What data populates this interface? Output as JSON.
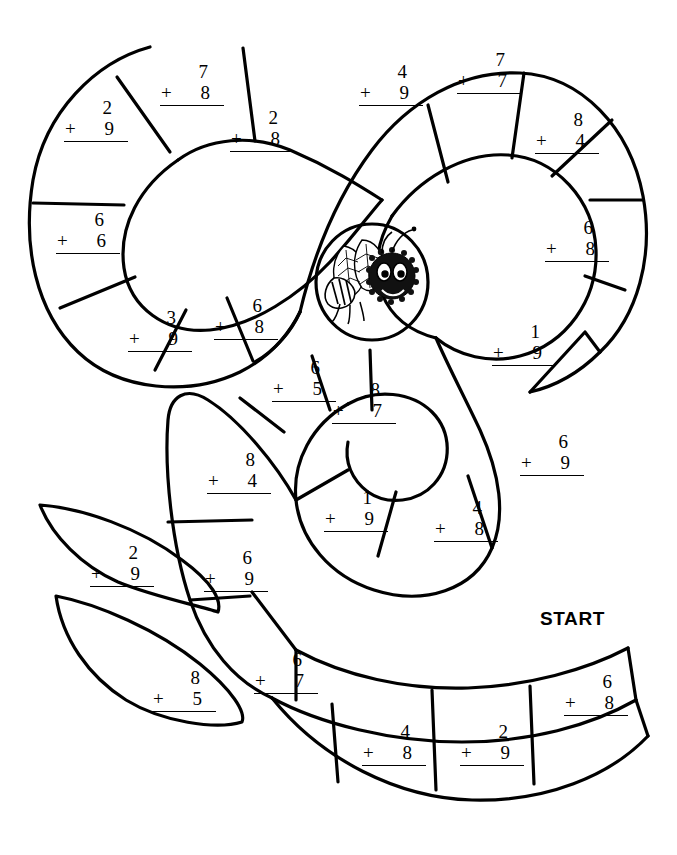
{
  "worksheet": {
    "title": "Bee Path Addition Maze",
    "start_label": "START",
    "ink_color": "#000000",
    "paper_color": "#ffffff"
  },
  "center_art": {
    "name": "bee-illustration",
    "description": "cartoon bee with leaf wings inside a circle"
  },
  "problems": [
    {
      "id": "p01",
      "addend1": "2",
      "operator": "+",
      "addend2": "9",
      "x": 62,
      "y": 98,
      "region": "left-lobe"
    },
    {
      "id": "p02",
      "addend1": "7",
      "operator": "+",
      "addend2": "8",
      "x": 158,
      "y": 62,
      "region": "left-lobe"
    },
    {
      "id": "p03",
      "addend1": "2",
      "operator": "+",
      "addend2": "8",
      "x": 228,
      "y": 108,
      "region": "left-lobe"
    },
    {
      "id": "p04",
      "addend1": "6",
      "operator": "+",
      "addend2": "6",
      "x": 54,
      "y": 210,
      "region": "left-lobe"
    },
    {
      "id": "p05",
      "addend1": "3",
      "operator": "+",
      "addend2": "9",
      "x": 126,
      "y": 308,
      "region": "left-lobe"
    },
    {
      "id": "p06",
      "addend1": "6",
      "operator": "+",
      "addend2": "8",
      "x": 212,
      "y": 296,
      "region": "left-lobe"
    },
    {
      "id": "p07",
      "addend1": "4",
      "operator": "+",
      "addend2": "9",
      "x": 357,
      "y": 62,
      "region": "right-lobe"
    },
    {
      "id": "p08",
      "addend1": "7",
      "operator": "+",
      "addend2": "7",
      "x": 455,
      "y": 50,
      "region": "right-lobe"
    },
    {
      "id": "p09",
      "addend1": "8",
      "operator": "+",
      "addend2": "4",
      "x": 533,
      "y": 110,
      "region": "right-lobe"
    },
    {
      "id": "p10",
      "addend1": "6",
      "operator": "+",
      "addend2": "8",
      "x": 543,
      "y": 218,
      "region": "right-lobe"
    },
    {
      "id": "p11",
      "addend1": "1",
      "operator": "+",
      "addend2": "9",
      "x": 490,
      "y": 322,
      "region": "right-lobe"
    },
    {
      "id": "p12",
      "addend1": "6",
      "operator": "+",
      "addend2": "9",
      "x": 518,
      "y": 432,
      "region": "spiral-outer"
    },
    {
      "id": "p13",
      "addend1": "6",
      "operator": "+",
      "addend2": "5",
      "x": 270,
      "y": 358,
      "region": "spiral-inner"
    },
    {
      "id": "p14",
      "addend1": "8",
      "operator": "+",
      "addend2": "7",
      "x": 330,
      "y": 380,
      "region": "spiral-inner"
    },
    {
      "id": "p15",
      "addend1": "8",
      "operator": "+",
      "addend2": "4",
      "x": 205,
      "y": 450,
      "region": "spiral-inner"
    },
    {
      "id": "p16",
      "addend1": "1",
      "operator": "+",
      "addend2": "9",
      "x": 322,
      "y": 488,
      "region": "spiral-inner"
    },
    {
      "id": "p17",
      "addend1": "4",
      "operator": "+",
      "addend2": "8",
      "x": 432,
      "y": 498,
      "region": "spiral-inner"
    },
    {
      "id": "p18",
      "addend1": "6",
      "operator": "+",
      "addend2": "9",
      "x": 202,
      "y": 548,
      "region": "spiral-inner"
    },
    {
      "id": "p19",
      "addend1": "2",
      "operator": "+",
      "addend2": "9",
      "x": 88,
      "y": 543,
      "region": "leaf-upper"
    },
    {
      "id": "p20",
      "addend1": "8",
      "operator": "+",
      "addend2": "5",
      "x": 150,
      "y": 668,
      "region": "leaf-lower"
    },
    {
      "id": "p21",
      "addend1": "6",
      "operator": "+",
      "addend2": "7",
      "x": 252,
      "y": 650,
      "region": "bottom-path"
    },
    {
      "id": "p22",
      "addend1": "4",
      "operator": "+",
      "addend2": "8",
      "x": 360,
      "y": 722,
      "region": "bottom-strip"
    },
    {
      "id": "p23",
      "addend1": "2",
      "operator": "+",
      "addend2": "9",
      "x": 458,
      "y": 722,
      "region": "bottom-strip"
    },
    {
      "id": "p24",
      "addend1": "6",
      "operator": "+",
      "addend2": "8",
      "x": 562,
      "y": 672,
      "region": "bottom-strip"
    }
  ],
  "start": {
    "x": 540,
    "y": 608
  }
}
